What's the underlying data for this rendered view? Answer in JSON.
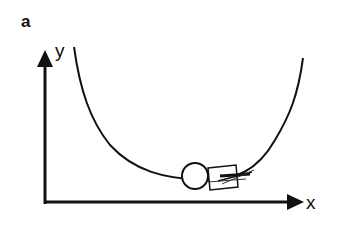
{
  "figure": {
    "panel_label": "a",
    "x_axis_label": "x",
    "y_axis_label": "y",
    "elements": {
      "curve": "potential-well",
      "ball": "circle",
      "cart": "rectangle-with-strokes"
    },
    "colors": {
      "stroke": "#111111",
      "background": "#ffffff"
    }
  }
}
